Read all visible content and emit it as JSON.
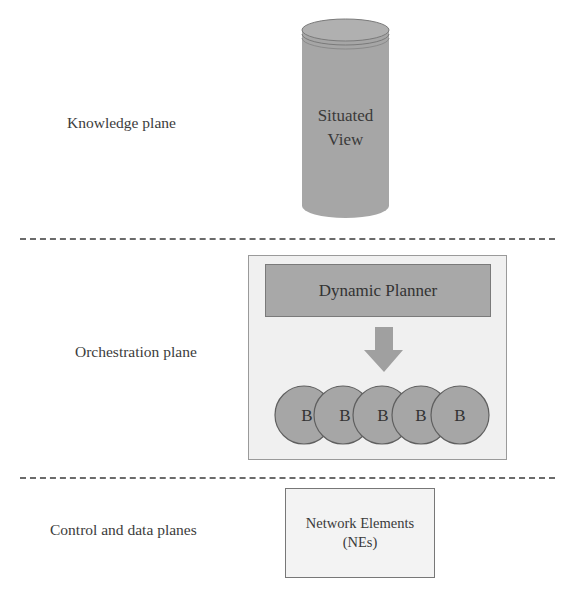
{
  "planes": [
    {
      "label": "Knowledge plane"
    },
    {
      "label": "Orchestration plane"
    },
    {
      "label": "Control and data planes"
    }
  ],
  "knowledge": {
    "store": {
      "line1": "Situated",
      "line2": "View",
      "shape": "cylinder-icon"
    }
  },
  "orchestration": {
    "planner_label": "Dynamic Planner",
    "arrow": "down-arrow-icon",
    "behaviors": [
      "B",
      "B",
      "B",
      "B",
      "B"
    ]
  },
  "control": {
    "box_line1": "Network Elements",
    "box_line2": "(NEs)"
  },
  "colors": {
    "shape_fill": "#a6a6a6",
    "shape_stroke": "#5f5f5f",
    "panel_fill": "#f0f0f0",
    "dash": "#6a6a6a"
  }
}
